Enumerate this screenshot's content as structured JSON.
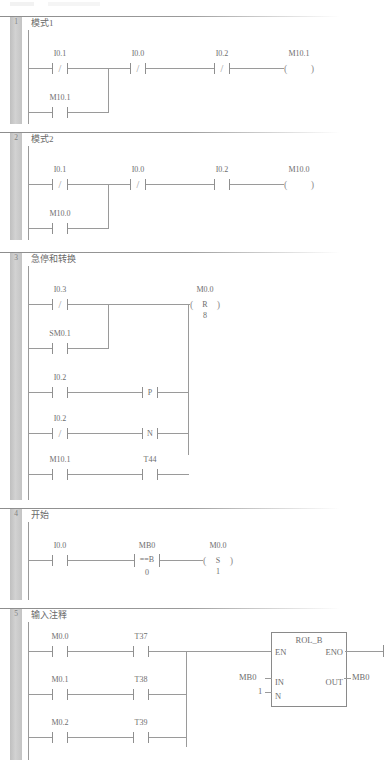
{
  "editor": {
    "type": "ladder-logic-editor",
    "language": "LAD",
    "colors": {
      "wire": "#9a9a9a",
      "text": "#6e6e6e",
      "gutter": "#c9c9c9",
      "background": "#ffffff"
    }
  },
  "networks": [
    {
      "number": "1",
      "title": "模式1",
      "rows": [
        {
          "elements": [
            {
              "kind": "contact",
              "contact_type": "nc",
              "symbol": "/",
              "label": "I0.1"
            },
            {
              "kind": "contact",
              "contact_type": "nc",
              "symbol": "/",
              "label": "I0.0"
            },
            {
              "kind": "contact",
              "contact_type": "nc",
              "symbol": "/",
              "label": "I0.2"
            },
            {
              "kind": "coil",
              "coil_type": "output",
              "label": "M10.1",
              "inner": "",
              "operand": ""
            }
          ]
        },
        {
          "branch": true,
          "elements": [
            {
              "kind": "contact",
              "contact_type": "no",
              "symbol": "",
              "label": "M10.1"
            }
          ]
        }
      ]
    },
    {
      "number": "2",
      "title": "模式2",
      "rows": [
        {
          "elements": [
            {
              "kind": "contact",
              "contact_type": "nc",
              "symbol": "/",
              "label": "I0.1"
            },
            {
              "kind": "contact",
              "contact_type": "nc",
              "symbol": "/",
              "label": "I0.0"
            },
            {
              "kind": "contact",
              "contact_type": "no",
              "symbol": "",
              "label": "I0.2"
            },
            {
              "kind": "coil",
              "coil_type": "output",
              "label": "M10.0",
              "inner": "",
              "operand": ""
            }
          ]
        },
        {
          "branch": true,
          "elements": [
            {
              "kind": "contact",
              "contact_type": "no",
              "symbol": "",
              "label": "M10.0"
            }
          ]
        }
      ]
    },
    {
      "number": "3",
      "title": "急停和转换",
      "rows": [
        {
          "elements": [
            {
              "kind": "contact",
              "contact_type": "nc",
              "symbol": "/",
              "label": "I0.3"
            },
            {
              "kind": "coil",
              "coil_type": "reset",
              "label": "M0.0",
              "inner": "R",
              "operand": "8"
            }
          ]
        },
        {
          "branch": true,
          "elements": [
            {
              "kind": "contact",
              "contact_type": "no",
              "symbol": "",
              "label": "SM0.1"
            }
          ]
        },
        {
          "branch": true,
          "elements": [
            {
              "kind": "contact",
              "contact_type": "no",
              "symbol": "",
              "label": "I0.2"
            },
            {
              "kind": "contact",
              "contact_type": "positive-edge",
              "symbol": "P",
              "label": ""
            }
          ]
        },
        {
          "branch": true,
          "elements": [
            {
              "kind": "contact",
              "contact_type": "nc",
              "symbol": "/",
              "label": "I0.2"
            },
            {
              "kind": "contact",
              "contact_type": "negative-edge",
              "symbol": "N",
              "label": ""
            }
          ]
        },
        {
          "branch": true,
          "elements": [
            {
              "kind": "contact",
              "contact_type": "no",
              "symbol": "",
              "label": "M10.1"
            },
            {
              "kind": "contact",
              "contact_type": "no",
              "symbol": "",
              "label": "T44"
            }
          ]
        }
      ]
    },
    {
      "number": "4",
      "title": "开始",
      "rows": [
        {
          "elements": [
            {
              "kind": "contact",
              "contact_type": "no",
              "symbol": "",
              "label": "I0.0"
            },
            {
              "kind": "compare",
              "contact_type": "compare",
              "symbol": "==B",
              "label": "MB0",
              "operand": "0"
            },
            {
              "kind": "coil",
              "coil_type": "set",
              "label": "M0.0",
              "inner": "S",
              "operand": "1"
            }
          ]
        }
      ]
    },
    {
      "number": "5",
      "title": "输入注释",
      "rows": [
        {
          "elements": [
            {
              "kind": "contact",
              "contact_type": "no",
              "symbol": "",
              "label": "M0.0"
            },
            {
              "kind": "contact",
              "contact_type": "no",
              "symbol": "",
              "label": "T37"
            }
          ]
        },
        {
          "branch": true,
          "elements": [
            {
              "kind": "contact",
              "contact_type": "no",
              "symbol": "",
              "label": "M0.1"
            },
            {
              "kind": "contact",
              "contact_type": "no",
              "symbol": "",
              "label": "T38"
            }
          ]
        },
        {
          "branch": true,
          "elements": [
            {
              "kind": "contact",
              "contact_type": "no",
              "symbol": "",
              "label": "M0.2"
            },
            {
              "kind": "contact",
              "contact_type": "no",
              "symbol": "",
              "label": "T39"
            }
          ]
        }
      ],
      "block": {
        "name": "ROL_B",
        "pins_left": [
          "EN",
          "IN",
          "N"
        ],
        "pins_right": [
          "ENO",
          "OUT"
        ],
        "arg_in": "MB0",
        "arg_n": "1",
        "arg_out": "MB0"
      }
    }
  ]
}
